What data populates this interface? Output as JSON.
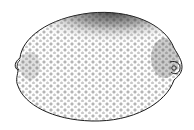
{
  "figure": {
    "style": "stippled pen-and-ink illustration",
    "colors": {
      "background": "#ffffff",
      "ink": "#1a1a1a",
      "shading": "#333333"
    }
  }
}
